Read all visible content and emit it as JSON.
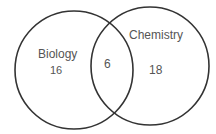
{
  "diagram": {
    "type": "venn",
    "sets": [
      {
        "name": "Biology",
        "only_value": "16"
      },
      {
        "name": "Chemistry",
        "only_value": "18"
      }
    ],
    "intersection_value": "6",
    "stroke_color": "#333333",
    "text_color": "#555555"
  }
}
